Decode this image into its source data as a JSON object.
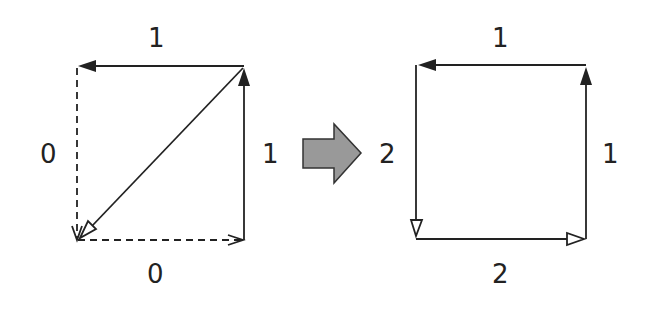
{
  "diagram": {
    "left_graph": {
      "edges": [
        {
          "id": "top",
          "label": "1",
          "style": "solid",
          "direction": "right-to-left",
          "head": "filled"
        },
        {
          "id": "right",
          "label": "1",
          "style": "solid",
          "direction": "bottom-to-top",
          "head": "filled"
        },
        {
          "id": "left",
          "label": "0",
          "style": "dashed",
          "direction": "top-to-bottom",
          "head": "open-line"
        },
        {
          "id": "bottom",
          "label": "0",
          "style": "dashed",
          "direction": "left-to-right",
          "head": "open-line"
        },
        {
          "id": "diagonal",
          "label": "",
          "style": "solid",
          "direction": "top-right-to-bottom-left",
          "head": "hollow"
        }
      ]
    },
    "transition_arrow": {
      "icon": "right-arrow-icon",
      "fill": "#999999"
    },
    "right_graph": {
      "edges": [
        {
          "id": "top",
          "label": "1",
          "style": "solid",
          "direction": "right-to-left",
          "head": "filled"
        },
        {
          "id": "right",
          "label": "1",
          "style": "solid",
          "direction": "bottom-to-top",
          "head": "filled"
        },
        {
          "id": "left",
          "label": "2",
          "style": "solid",
          "direction": "top-to-bottom",
          "head": "hollow"
        },
        {
          "id": "bottom",
          "label": "2",
          "style": "solid",
          "direction": "left-to-right",
          "head": "hollow"
        }
      ]
    },
    "colors": {
      "line": "#222222",
      "arrow_fill": "#999999",
      "background": "#ffffff"
    }
  }
}
